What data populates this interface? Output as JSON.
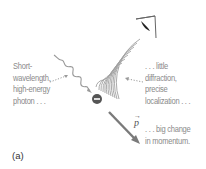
{
  "figure": {
    "panel_label": "(a)",
    "labels": {
      "photon": [
        "Short-",
        "wavelength,",
        "high-energy",
        "photon . . ."
      ],
      "diffraction": [
        ". . . little",
        "diffraction,",
        "precise",
        "localization . . ."
      ],
      "momentum": [
        ". . . big change",
        "in momentum."
      ],
      "momentum_symbol": "p",
      "momentum_vector_mark": "→"
    },
    "elements": {
      "photon_wave": "wavy-incoming-photon",
      "electron": "electron-minus-symbol",
      "scattered_wavefronts": "diffraction-arcs",
      "observer": "eye-icon",
      "recoil_arrow": "momentum-arrow"
    },
    "colors": {
      "text": "#8a8a8a",
      "lines": "#9a9a9a",
      "electron": "#555555",
      "arrow": "#7a7a7a",
      "eye_pupil": "#222222"
    }
  }
}
